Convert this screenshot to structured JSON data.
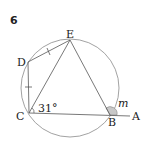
{
  "problem_number": "6",
  "points": {
    "A": "A",
    "B": "B",
    "C": "C",
    "D": "D",
    "E": "E"
  },
  "angle_label_C": "31°",
  "angle_label_B": "m",
  "colors": {
    "stroke": "#555555",
    "circle": "#8a8a8a",
    "shade": "#c8c8c8",
    "text": "#222222"
  },
  "tick_marks": [
    "DE",
    "DC"
  ]
}
